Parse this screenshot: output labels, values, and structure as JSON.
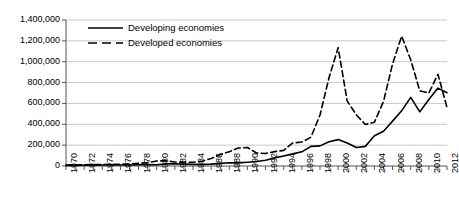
{
  "chart_data": {
    "type": "line",
    "title": "",
    "xlabel": "",
    "ylabel": "",
    "xlim": [
      1970,
      2012
    ],
    "ylim": [
      0,
      1400000
    ],
    "grid": true,
    "legend_position": "top-left",
    "ytick_labels": [
      "1,400,000",
      "1,200,000",
      "1,000,000",
      "800,000",
      "600,000",
      "400,000",
      "200,000",
      "0"
    ],
    "ytick_values": [
      1400000,
      1200000,
      1000000,
      800000,
      600000,
      400000,
      200000,
      0
    ],
    "xtick_labels": [
      "1970",
      "1972",
      "1974",
      "1976",
      "1978",
      "1980",
      "1982",
      "1984",
      "1986",
      "1988",
      "1990",
      "1992",
      "1994",
      "1996",
      "1998",
      "2000",
      "2002",
      "2004",
      "2006",
      "2008",
      "2010",
      "2012"
    ],
    "x": [
      1970,
      1971,
      1972,
      1973,
      1974,
      1975,
      1976,
      1977,
      1978,
      1979,
      1980,
      1981,
      1982,
      1983,
      1984,
      1985,
      1986,
      1987,
      1988,
      1989,
      1990,
      1991,
      1992,
      1993,
      1994,
      1995,
      1996,
      1997,
      1998,
      1999,
      2000,
      2001,
      2002,
      2003,
      2004,
      2005,
      2006,
      2007,
      2008,
      2009,
      2010,
      2011,
      2012
    ],
    "series": [
      {
        "name": "Developing economies",
        "style": "solid",
        "color": "#000000",
        "values": [
          5000,
          6000,
          7000,
          8000,
          9000,
          11000,
          10000,
          10000,
          12000,
          14000,
          12000,
          20000,
          22000,
          18000,
          16000,
          16000,
          18000,
          25000,
          31000,
          30000,
          36000,
          43000,
          55000,
          78000,
          96000,
          116000,
          136000,
          188000,
          193000,
          232000,
          253000,
          220000,
          178000,
          188000,
          290000,
          334000,
          430000,
          529000,
          658000,
          519000,
          637000,
          747000,
          703000
        ]
      },
      {
        "name": "Developed economies",
        "style": "dashed",
        "color": "#000000",
        "values": [
          9000,
          11000,
          12000,
          14000,
          14000,
          17000,
          17000,
          19000,
          25000,
          32000,
          48000,
          50000,
          39000,
          35000,
          36000,
          45000,
          72000,
          110000,
          137000,
          172000,
          177000,
          125000,
          120000,
          138000,
          150000,
          221000,
          230000,
          276000,
          489000,
          849000,
          1135000,
          623000,
          491000,
          398000,
          420000,
          619000,
          979000,
          1245000,
          1019000,
          721000,
          700000,
          880000,
          561000
        ]
      }
    ]
  }
}
